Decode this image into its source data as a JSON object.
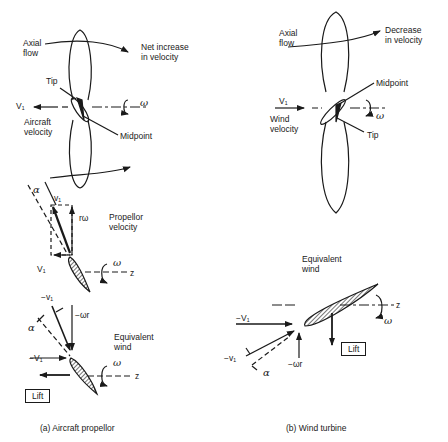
{
  "panel_a": {
    "caption": "(a) Aircraft propellor",
    "top": {
      "axial_flow": [
        "Axial",
        "flow"
      ],
      "net_increase": [
        "Net increase",
        "in velocity"
      ],
      "tip": "Tip",
      "midpoint": "Midpoint",
      "v1": "V₁",
      "aircraft_velocity": [
        "Aircraft",
        "velocity"
      ],
      "omega": "ω"
    },
    "middle": {
      "alpha": "α",
      "v1_top": "v₁",
      "r_omega": "rω",
      "propellor_velocity": [
        "Propellor",
        "velocity"
      ],
      "v1_bottom": "V₁",
      "omega": "ω",
      "z": "z"
    },
    "bottom": {
      "neg_v1_top": "−v₁",
      "neg_omega_r": "−ωr",
      "alpha": "α",
      "equivalent_wind": [
        "Equivalent",
        "wind"
      ],
      "neg_V1": "−V₁",
      "omega": "ω",
      "z": "z",
      "lift": "Lift"
    }
  },
  "panel_b": {
    "caption": "(b) Wind turbine",
    "top": {
      "axial_flow": [
        "Axial",
        "flow"
      ],
      "decrease": [
        "Decrease",
        "in velocity"
      ],
      "midpoint": "Midpoint",
      "tip": "Tip",
      "v1": "V₁",
      "wind_velocity": [
        "Wind",
        "velocity"
      ],
      "omega": "ω"
    },
    "bottom": {
      "equivalent_wind": [
        "Equivalent",
        "wind"
      ],
      "neg_V1": "−V₁",
      "neg_v1": "−v₁",
      "alpha": "α",
      "neg_omega_r": "−ωr",
      "lift": "Lift",
      "omega": "ω",
      "z": "z"
    }
  }
}
